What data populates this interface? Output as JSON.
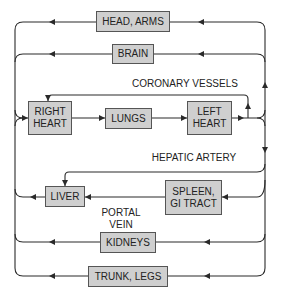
{
  "diagram": {
    "colors": {
      "box_fill": "#cfcfcf",
      "line": "#2a2a2a",
      "text": "#222222"
    },
    "boxes": {
      "head_arms": "HEAD, ARMS",
      "brain": "BRAIN",
      "right_heart": "RIGHT\nHEART",
      "lungs": "LUNGS",
      "left_heart": "LEFT\nHEART",
      "liver": "LIVER",
      "spleen_gi": "SPLEEN,\nGI TRACT",
      "kidneys": "KIDNEYS",
      "trunk_legs": "TRUNK, LEGS"
    },
    "labels": {
      "coronary_vessels": "CORONARY VESSELS",
      "hepatic_artery": "HEPATIC ARTERY",
      "portal_vein": "PORTAL\nVEIN"
    },
    "flows": [
      {
        "from": "RIGHT HEART",
        "to": "LUNGS"
      },
      {
        "from": "LUNGS",
        "to": "LEFT HEART"
      },
      {
        "from": "LEFT HEART",
        "to": "HEAD, ARMS"
      },
      {
        "from": "LEFT HEART",
        "to": "BRAIN"
      },
      {
        "from": "LEFT HEART",
        "to": "CORONARY VESSELS"
      },
      {
        "from": "CORONARY VESSELS",
        "to": "RIGHT HEART"
      },
      {
        "from": "LEFT HEART",
        "to": "HEPATIC ARTERY"
      },
      {
        "from": "HEPATIC ARTERY",
        "to": "LIVER"
      },
      {
        "from": "LEFT HEART",
        "to": "SPLEEN, GI TRACT"
      },
      {
        "from": "SPLEEN, GI TRACT",
        "to": "LIVER",
        "via": "PORTAL VEIN"
      },
      {
        "from": "LEFT HEART",
        "to": "KIDNEYS"
      },
      {
        "from": "LEFT HEART",
        "to": "TRUNK, LEGS"
      },
      {
        "from": "HEAD, ARMS",
        "to": "RIGHT HEART"
      },
      {
        "from": "BRAIN",
        "to": "RIGHT HEART"
      },
      {
        "from": "LIVER",
        "to": "RIGHT HEART"
      },
      {
        "from": "KIDNEYS",
        "to": "RIGHT HEART"
      },
      {
        "from": "TRUNK, LEGS",
        "to": "RIGHT HEART"
      }
    ]
  }
}
